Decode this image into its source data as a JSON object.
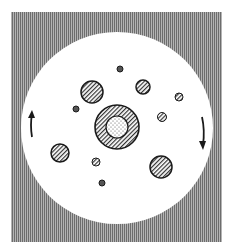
{
  "diagram": {
    "frame": {
      "x": 11,
      "y": 12,
      "w": 211,
      "h": 230,
      "fill": "#8a8a8a"
    },
    "disk": {
      "cx": 117,
      "cy": 128,
      "r": 96,
      "fill": "#ffffff"
    },
    "center_body": {
      "cx": 117,
      "cy": 127,
      "r_outer": 22,
      "r_inner": 11,
      "outer_fill": "hatched",
      "inner_fill": "dotted"
    },
    "particles": [
      {
        "cx": 92,
        "cy": 92,
        "r": 11,
        "fill": "hatched"
      },
      {
        "cx": 143,
        "cy": 87,
        "r": 7,
        "fill": "hatched"
      },
      {
        "cx": 120,
        "cy": 69,
        "r": 3,
        "fill": "solid"
      },
      {
        "cx": 179,
        "cy": 97,
        "r": 4,
        "fill": "hatched"
      },
      {
        "cx": 76,
        "cy": 109,
        "r": 3,
        "fill": "solid"
      },
      {
        "cx": 162,
        "cy": 117,
        "r": 4.5,
        "fill": "hatched"
      },
      {
        "cx": 60,
        "cy": 153,
        "r": 9,
        "fill": "hatched"
      },
      {
        "cx": 96,
        "cy": 162,
        "r": 4,
        "fill": "hatched"
      },
      {
        "cx": 161,
        "cy": 167,
        "r": 11,
        "fill": "hatched"
      },
      {
        "cx": 102,
        "cy": 183,
        "r": 3,
        "fill": "solid"
      }
    ],
    "arrows": [
      {
        "name": "left-arrow-up",
        "direction": "up",
        "x": 32,
        "y1": 137,
        "y2": 112
      },
      {
        "name": "right-arrow-down",
        "direction": "down",
        "x": 203,
        "y1": 117,
        "y2": 148
      }
    ],
    "colors": {
      "stroke": "#1a1a1a",
      "hatch": "#333333",
      "frame_line": "#6d6d6d"
    }
  }
}
